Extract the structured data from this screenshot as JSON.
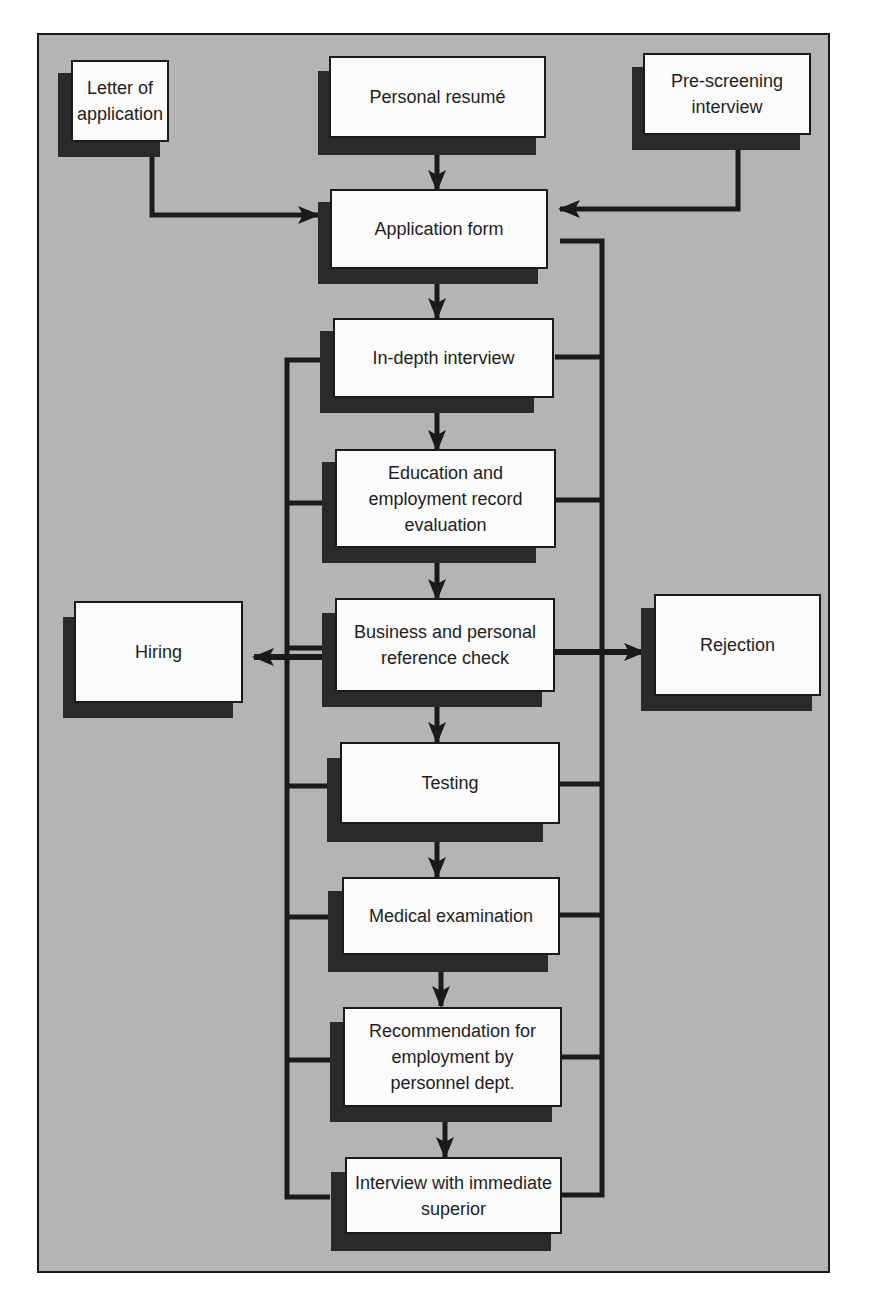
{
  "diagram": {
    "title": "",
    "type": "flowchart",
    "colors": {
      "background": "#b4b4b4",
      "box_fill": "#fbfbfb",
      "shadow": "#2a2a2a",
      "line": "#1a1a1a",
      "text": "#1e1e1e"
    },
    "inputs": [
      {
        "id": "letter",
        "label": "Letter of application"
      },
      {
        "id": "resume",
        "label": "Personal resumé"
      },
      {
        "id": "prescreen",
        "label": "Pre-screening interview"
      }
    ],
    "steps": [
      {
        "id": "appform",
        "label": "Application form"
      },
      {
        "id": "indepth",
        "label": "In-depth interview"
      },
      {
        "id": "education",
        "label": "Education and employment record evaluation"
      },
      {
        "id": "reference",
        "label": "Business and personal reference check"
      },
      {
        "id": "testing",
        "label": "Testing"
      },
      {
        "id": "medical",
        "label": "Medical examination"
      },
      {
        "id": "recommend",
        "label": "Recommendation for employment by personnel dept."
      },
      {
        "id": "superior",
        "label": "Interview with immediate superior"
      }
    ],
    "outcomes": [
      {
        "id": "hiring",
        "label": "Hiring"
      },
      {
        "id": "rejection",
        "label": "Rejection"
      }
    ],
    "edges": [
      [
        "letter",
        "appform"
      ],
      [
        "resume",
        "appform"
      ],
      [
        "prescreen",
        "appform"
      ],
      [
        "appform",
        "indepth"
      ],
      [
        "indepth",
        "education"
      ],
      [
        "education",
        "reference"
      ],
      [
        "reference",
        "testing"
      ],
      [
        "testing",
        "medical"
      ],
      [
        "medical",
        "recommend"
      ],
      [
        "recommend",
        "superior"
      ],
      [
        "steps-left-bus",
        "hiring"
      ],
      [
        "steps-right-bus",
        "rejection"
      ]
    ]
  }
}
